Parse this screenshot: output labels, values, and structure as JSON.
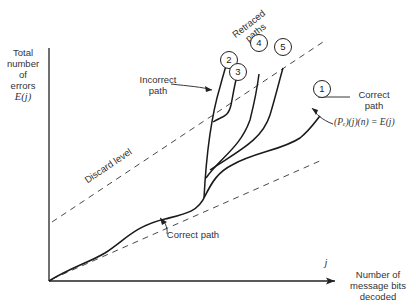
{
  "axes": {
    "y_label_lines": [
      "Total",
      "number",
      "of",
      "errors"
    ],
    "y_symbol": "E(j)",
    "x_symbol": "j",
    "x_label_lines": [
      "Number of",
      "message bits",
      "decoded"
    ]
  },
  "labels": {
    "retraced_paths": [
      "Retraced",
      "paths"
    ],
    "incorrect_path": [
      "Incorrect",
      "path"
    ],
    "correct_path_right": [
      "Correct",
      "path"
    ],
    "equation": "(Pₑ)(j)(n) = E(j)",
    "discard_level": "Discard level",
    "correct_path_bottom": "Correct path"
  },
  "nodes": [
    {
      "id": "1",
      "label": "1"
    },
    {
      "id": "2",
      "label": "2"
    },
    {
      "id": "3",
      "label": "3"
    },
    {
      "id": "4",
      "label": "4"
    },
    {
      "id": "5",
      "label": "5"
    }
  ],
  "colors": {
    "ink": "#222222",
    "background": "#ffffff"
  }
}
